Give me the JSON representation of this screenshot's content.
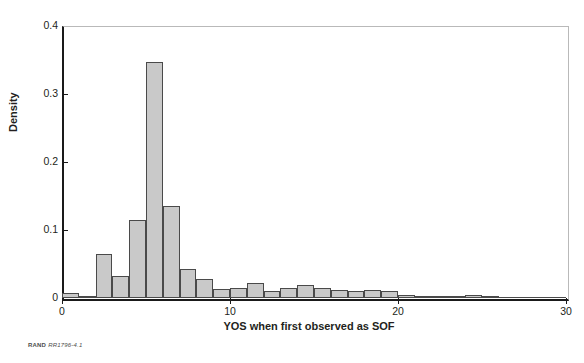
{
  "figure": {
    "footnote_org": "RAND",
    "footnote_ref": "RR1796-4.1"
  },
  "chart_data": {
    "type": "bar",
    "title": "",
    "subtitle": "",
    "xlabel": "YOS when first observed as SOF",
    "ylabel": "Density",
    "xlim": [
      0,
      30
    ],
    "ylim": [
      0,
      0.4
    ],
    "xticks": [
      0,
      10,
      20,
      30
    ],
    "xtick_labels": [
      "0",
      "10",
      "20",
      "30"
    ],
    "yticks": [
      0,
      0.1,
      0.2,
      0.3,
      0.4
    ],
    "ytick_labels": [
      "0",
      "0.1",
      "0.2",
      "0.3",
      "0.4"
    ],
    "grid": false,
    "legend": null,
    "bar_fill_color": "#c9c9c9",
    "bar_edge_color": "#4a4a4a",
    "axis_color": "#1a1a1a",
    "bin_width": 1,
    "bin_starts": [
      0,
      1,
      2,
      3,
      4,
      5,
      6,
      7,
      8,
      9,
      10,
      11,
      12,
      13,
      14,
      15,
      16,
      17,
      18,
      19,
      20,
      21,
      22,
      23,
      24,
      25,
      26,
      27,
      28,
      29
    ],
    "categories": [
      "0-1",
      "1-2",
      "2-3",
      "3-4",
      "4-5",
      "5-6",
      "6-7",
      "7-8",
      "8-9",
      "9-10",
      "10-11",
      "11-12",
      "12-13",
      "13-14",
      "14-15",
      "15-16",
      "16-17",
      "17-18",
      "18-19",
      "19-20",
      "20-21",
      "21-22",
      "22-23",
      "23-24",
      "24-25",
      "25-26",
      "26-27",
      "27-28",
      "28-29",
      "29-30"
    ],
    "values": [
      0.008,
      0.002,
      0.065,
      0.033,
      0.115,
      0.347,
      0.135,
      0.042,
      0.028,
      0.013,
      0.014,
      0.022,
      0.011,
      0.015,
      0.019,
      0.015,
      0.012,
      0.01,
      0.012,
      0.01,
      0.004,
      0.002,
      0.003,
      0.002,
      0.005,
      0.002,
      0.0,
      0.0,
      0.0,
      0.0
    ]
  }
}
